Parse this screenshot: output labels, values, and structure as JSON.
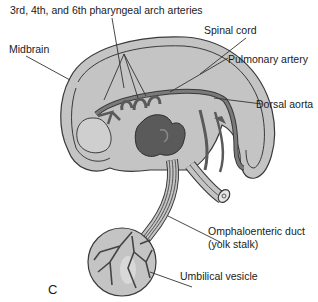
{
  "figure": {
    "panel_letter": "C",
    "labels": {
      "pharyngeal_arch_arteries": "3rd, 4th, and 6th pharyngeal arch arteries",
      "midbrain": "Midbrain",
      "spinal_cord": "Spinal cord",
      "pulmonary_artery": "Pulmonary artery",
      "dorsal_aorta": "Dorsal aorta",
      "omphaloenteric_duct_line1": "Omphaloenteric duct",
      "omphaloenteric_duct_line2": "(yolk stalk)",
      "umbilical_vesicle": "Umbilical vesicle"
    },
    "colors": {
      "embryo_fill": "#c4c4c4",
      "vessel_fill": "#6e6e6e",
      "heart_fill": "#5a5a5a",
      "outline": "#3a3a3a",
      "leader_line": "#333333"
    }
  }
}
